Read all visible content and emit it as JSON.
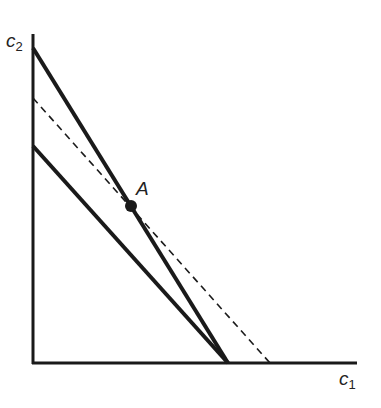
{
  "diagram": {
    "axes": {
      "y_label": "c",
      "y_label_sub": "2",
      "x_label": "c",
      "x_label_sub": "1"
    },
    "point_label": "A",
    "lines": [
      {
        "name": "steep-budget-line",
        "style": "solid",
        "from": [
          33,
          48
        ],
        "to": [
          228,
          363
        ]
      },
      {
        "name": "shallow-budget-line",
        "style": "solid",
        "from": [
          33,
          146
        ],
        "to": [
          228,
          363
        ]
      },
      {
        "name": "dashed-line",
        "style": "dashed",
        "from": [
          33,
          98
        ],
        "to": [
          270,
          363
        ]
      }
    ],
    "point": {
      "x": 131,
      "y": 206
    },
    "colors": {
      "line": "#1a1a1a",
      "background": "#ffffff"
    }
  }
}
